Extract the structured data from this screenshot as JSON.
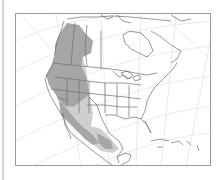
{
  "map": {
    "title": "Range map of North America",
    "region": "North America",
    "projection": "conic graticule",
    "colors": {
      "background": "#ffffff",
      "frame": "#9a9a9a",
      "graticule": "#e2e2e2",
      "land_outline": "#6e6e6e",
      "primary_range": "#a6a6a6",
      "secondary_range": "#cfcfcf"
    },
    "legend": [],
    "ranges": [
      {
        "name": "primary-range",
        "description": "Western Canada and western United States (Pacific Northwest, Great Basin, Rocky Mountains)"
      },
      {
        "name": "secondary-range",
        "description": "California, Arizona/New Mexico, and Mexico south to Central America"
      }
    ]
  }
}
